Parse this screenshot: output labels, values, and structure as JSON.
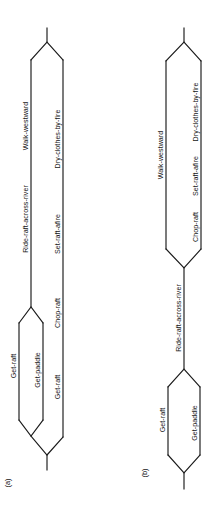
{
  "figure": {
    "type": "partial-order-plan-diagram",
    "orientation": "rotated-90-counterclockwise",
    "background_color": "#ffffff",
    "line_color": "#1a1a1a",
    "text_color": "#151515",
    "panels": [
      {
        "id": "a",
        "caption": "(a)",
        "description": "Partially ordered plan with two parallel threads branching from a common start and rejoining at a common finish.",
        "threads": [
          {
            "id": "a-thread-upper",
            "steps": [
              {
                "id": "a-get-raft",
                "label": "Get-raft"
              },
              {
                "id": "a-get-paddle",
                "label": "Get-paddle"
              },
              {
                "id": "a-ride-raft-across-river",
                "label": "Ride-raft-across-river"
              },
              {
                "id": "a-walk-westward",
                "label": "Walk-westward"
              }
            ]
          },
          {
            "id": "a-thread-lower",
            "steps": [
              {
                "id": "a-get-raft-2",
                "label": "Get-raft"
              },
              {
                "id": "a-chop-raft",
                "label": "Chop-raft"
              },
              {
                "id": "a-set-raft-afire",
                "label": "Set-raft-afire"
              },
              {
                "id": "a-dry-clothes-by-fire",
                "label": "Dry-clothes-by-fire"
              }
            ]
          }
        ],
        "labels": [
          "Get-raft",
          "Get-paddle",
          "Ride-raft-across-river",
          "Walk-westward",
          "Get-raft",
          "Chop-raft",
          "Set-raft-afire",
          "Dry-clothes-by-fire"
        ]
      },
      {
        "id": "b",
        "caption": "(b)",
        "description": "Partially ordered plan whose two initial steps join before a shared step, then split again into two parallel threads that rejoin at the finish.",
        "threads": [
          {
            "id": "b-initial-pair",
            "steps": [
              {
                "id": "b-get-raft",
                "label": "Get-raft"
              },
              {
                "id": "b-get-paddle",
                "label": "Get-paddle"
              }
            ]
          },
          {
            "id": "b-shared",
            "steps": [
              {
                "id": "b-ride-raft-across-river",
                "label": "Ride-raft-across-river"
              }
            ]
          },
          {
            "id": "b-thread-upper",
            "steps": [
              {
                "id": "b-walk-westward",
                "label": "Walk-westward"
              }
            ]
          },
          {
            "id": "b-thread-lower",
            "steps": [
              {
                "id": "b-chop-raft",
                "label": "Chop-raft"
              },
              {
                "id": "b-set-raft-afire",
                "label": "Set-raft-afire"
              },
              {
                "id": "b-dry-clothes-by-fire",
                "label": "Dry-clothes-by-fire"
              }
            ]
          }
        ],
        "labels": [
          "Get-raft",
          "Get-paddle",
          "Ride-raft-across-river",
          "Walk-westward",
          "Chop-raft",
          "Set-raft-afire",
          "Dry-clothes-by-fire"
        ]
      }
    ]
  }
}
